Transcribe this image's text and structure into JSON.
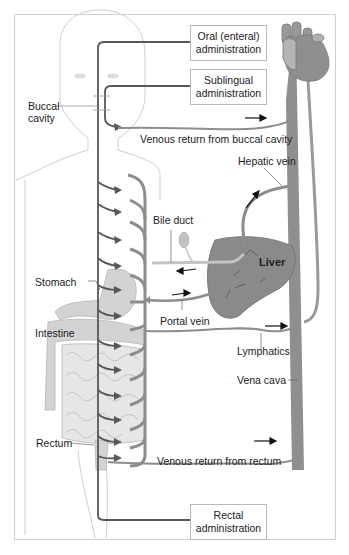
{
  "diagram": {
    "boxes": {
      "oral": [
        "Oral (enteral)",
        "administration"
      ],
      "sublingual": [
        "Sublingual",
        "administration"
      ],
      "rectal": [
        "Rectal",
        "administration"
      ]
    },
    "labels": {
      "buccal": [
        "Buccal",
        "cavity"
      ],
      "venous_buccal": "Venous return from buccal cavity",
      "hepatic_vein": "Hepatic vein",
      "bile_duct": "Bile duct",
      "liver": "Liver",
      "stomach": "Stomach",
      "portal_vein": "Portal vein",
      "intestine": "Intestine",
      "lymphatics": "Lymphatics",
      "vena_cava": "Vena cava",
      "rectum": "Rectum",
      "venous_rectum": "Venous return from rectum"
    },
    "colors": {
      "vessel": "#8d8d8d",
      "vessel_dark": "#5e5e5e",
      "organ": "#c9c9c9",
      "liver": "#8a8a8a",
      "heart": "#8f8f8f",
      "body_outline": "#c8c8c8",
      "route_line": "#555555"
    }
  }
}
